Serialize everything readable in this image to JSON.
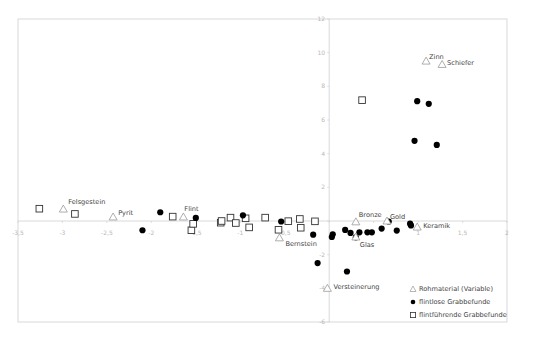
{
  "chart_data": {
    "type": "scatter",
    "title": "",
    "xlabel": "",
    "ylabel": "",
    "xlim": [
      -3.5,
      2
    ],
    "ylim": [
      -6,
      12
    ],
    "grid": false,
    "legend_position": "bottom-right",
    "x_ticks": [
      "-3,5",
      "-3",
      "-2,5",
      "-2",
      "-1,5",
      "-1",
      "-0,5",
      "0",
      "0,5",
      "1",
      "1,5",
      "2"
    ],
    "x_tick_values": [
      -3.5,
      -3,
      -2.5,
      -2,
      -1.5,
      -1,
      -0.5,
      0,
      0.5,
      1,
      1.5,
      2
    ],
    "y_ticks": [
      "12",
      "10",
      "8",
      "6",
      "4",
      "2",
      "0",
      "-2",
      "-4",
      "-6"
    ],
    "y_tick_values": [
      12,
      10,
      8,
      6,
      4,
      2,
      0,
      -2,
      -4,
      -6
    ],
    "series": [
      {
        "name": "Rohmaterial (Variable)",
        "marker": "triangle",
        "color": "#9a9a9a",
        "points": [
          {
            "label": "Felsgestein",
            "x": -2.99,
            "y": 0.71
          },
          {
            "label": "Pyrit",
            "x": -2.43,
            "y": 0.24
          },
          {
            "label": "Flint",
            "x": -1.64,
            "y": 0.24
          },
          {
            "label": "Bernstein",
            "x": -0.56,
            "y": -1.0
          },
          {
            "label": "Versteinerung",
            "x": -0.02,
            "y": -4.0
          },
          {
            "label": "Bronze",
            "x": 0.3,
            "y": -0.05
          },
          {
            "label": "Gold",
            "x": 0.65,
            "y": 0.0
          },
          {
            "label": "Glas",
            "x": 0.3,
            "y": -0.95
          },
          {
            "label": "Keramik",
            "x": 0.99,
            "y": -0.36
          },
          {
            "label": "Zinn",
            "x": 1.09,
            "y": 9.5
          },
          {
            "label": "Schiefer",
            "x": 1.27,
            "y": 9.3
          }
        ]
      },
      {
        "name": "flintlose Grabbefunde",
        "marker": "filled-circle",
        "color": "#000000",
        "points": [
          {
            "x": -2.1,
            "y": -0.55
          },
          {
            "x": -1.9,
            "y": 0.52
          },
          {
            "x": -1.5,
            "y": 0.18
          },
          {
            "x": -0.97,
            "y": 0.34
          },
          {
            "x": -0.54,
            "y": -0.03
          },
          {
            "x": -0.18,
            "y": -0.81
          },
          {
            "x": -0.13,
            "y": -2.5
          },
          {
            "x": 0.03,
            "y": -0.95
          },
          {
            "x": 0.04,
            "y": -0.79
          },
          {
            "x": 0.18,
            "y": -0.53
          },
          {
            "x": 0.2,
            "y": -3.0
          },
          {
            "x": 0.24,
            "y": -0.71
          },
          {
            "x": 0.3,
            "y": -0.97
          },
          {
            "x": 0.34,
            "y": -0.67
          },
          {
            "x": 0.43,
            "y": -0.67
          },
          {
            "x": 0.48,
            "y": -0.67
          },
          {
            "x": 0.59,
            "y": -0.45
          },
          {
            "x": 0.67,
            "y": -0.03
          },
          {
            "x": 0.76,
            "y": -0.57
          },
          {
            "x": 0.91,
            "y": -0.16
          },
          {
            "x": 0.92,
            "y": -0.26
          },
          {
            "x": 0.96,
            "y": 4.76
          },
          {
            "x": 0.99,
            "y": 7.12
          },
          {
            "x": 1.12,
            "y": 6.96
          },
          {
            "x": 1.21,
            "y": 4.52
          }
        ]
      },
      {
        "name": "flintführende Grabbefunde",
        "marker": "open-square",
        "color": "#333333",
        "points": [
          {
            "x": -3.26,
            "y": 0.73
          },
          {
            "x": -2.86,
            "y": 0.42
          },
          {
            "x": -1.76,
            "y": 0.26
          },
          {
            "x": -1.55,
            "y": -0.55
          },
          {
            "x": -1.53,
            "y": -0.17
          },
          {
            "x": -1.22,
            "y": -0.1
          },
          {
            "x": -1.21,
            "y": 0.0
          },
          {
            "x": -1.11,
            "y": 0.2
          },
          {
            "x": -1.05,
            "y": -0.12
          },
          {
            "x": -0.94,
            "y": 0.16
          },
          {
            "x": -0.9,
            "y": -0.38
          },
          {
            "x": -0.72,
            "y": 0.2
          },
          {
            "x": -0.57,
            "y": -0.52
          },
          {
            "x": -0.46,
            "y": -0.01
          },
          {
            "x": -0.33,
            "y": 0.12
          },
          {
            "x": -0.32,
            "y": -0.4
          },
          {
            "x": -0.16,
            "y": -0.02
          },
          {
            "x": 0.37,
            "y": 7.18
          }
        ]
      }
    ],
    "legend": [
      {
        "marker": "triangle",
        "label": "Rohmaterial (Variable)"
      },
      {
        "marker": "filled-circle",
        "label": "flintlose Grabbefunde"
      },
      {
        "marker": "open-square",
        "label": "flintführende Grabbefunde"
      }
    ]
  },
  "colors": {
    "frame": "#c8c8c8",
    "axis": "#c8c8c8",
    "tick_text": "#b8b8b8",
    "triangle": "#9a9a9a",
    "circle": "#000000",
    "square": "#333333",
    "label_text": "#444444"
  }
}
